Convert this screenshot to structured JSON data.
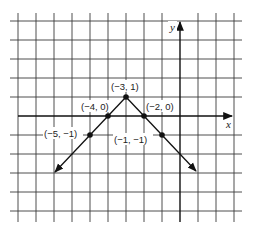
{
  "figure": {
    "axes": {
      "x_label": "x",
      "y_label": "y"
    },
    "colors": {
      "grid": "#3a3a3a",
      "axis": "#111111",
      "curve": "#111111",
      "background": "#ffffff"
    },
    "points": [
      {
        "x": -5,
        "y": -1,
        "label": "(−5, −1)"
      },
      {
        "x": -4,
        "y": 0,
        "label": "(−4, 0)"
      },
      {
        "x": -3,
        "y": 1,
        "label": "(−3, 1)"
      },
      {
        "x": -2,
        "y": 0,
        "label": "(−2, 0)"
      },
      {
        "x": -1,
        "y": -1,
        "label": "(−1, −1)"
      }
    ],
    "grid": {
      "x_min": -9,
      "x_max": 3,
      "y_min": -5,
      "y_max": 5
    }
  }
}
